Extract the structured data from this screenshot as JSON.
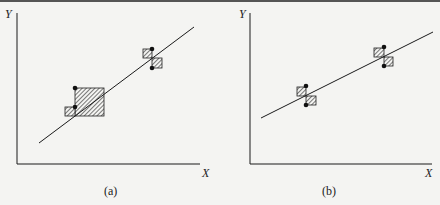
{
  "figure": {
    "panels": [
      {
        "id": "a",
        "caption": "(a)",
        "y_axis_label": "Y",
        "x_axis_label": "X",
        "description": "Regression line with two clusters of data points; lower cluster shows a large hatched rectangle (large residual squares), upper cluster shows small hatched squares"
      },
      {
        "id": "b",
        "caption": "(b)",
        "y_axis_label": "Y",
        "x_axis_label": "X",
        "description": "Regression line with two clusters of data points; each cluster shows small symmetric hatched residual squares above and below the line"
      }
    ]
  },
  "colors": {
    "ink": "#1a1a1a",
    "background": "#f4f4f2"
  }
}
